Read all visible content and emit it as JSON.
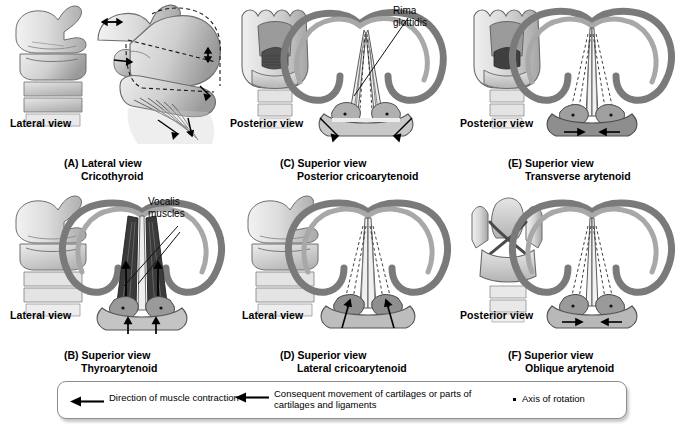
{
  "figure": {
    "panels": [
      {
        "id": "A",
        "thumb_view": "Lateral view",
        "caption_line1": "(A) Lateral view",
        "caption_line2": "Cricothyroid",
        "annotations": []
      },
      {
        "id": "C",
        "thumb_view": "Posterior view",
        "caption_line1": "(C) Superior view",
        "caption_line2": "Posterior cricoarytenoid",
        "annotations": [
          "Rima",
          "glottidis"
        ]
      },
      {
        "id": "E",
        "thumb_view": "Posterior view",
        "caption_line1": "(E) Superior view",
        "caption_line2": "Transverse arytenoid",
        "annotations": []
      },
      {
        "id": "B",
        "thumb_view": "Lateral view",
        "caption_line1": "(B) Superior view",
        "caption_line2": "Thyroarytenoid",
        "annotations": [
          "Vocalis",
          "muscles"
        ]
      },
      {
        "id": "D",
        "thumb_view": "Lateral view",
        "caption_line1": "(D) Superior view",
        "caption_line2": "Lateral cricoarytenoid",
        "annotations": []
      },
      {
        "id": "F",
        "thumb_view": "Posterior view",
        "caption_line1": "(F) Superior view",
        "caption_line2": "Oblique arytenoid",
        "annotations": []
      }
    ],
    "annotation_rima": "Rima\nglottidis",
    "annotation_rima_l1": "Rima",
    "annotation_rima_l2": "glottidis",
    "annotation_vocalis_l1": "Vocalis",
    "annotation_vocalis_l2": "muscles"
  },
  "legend": {
    "items": [
      {
        "icon": "left-arrow-icon",
        "text": "Direction of muscle contraction"
      },
      {
        "icon": "left-arrow-icon",
        "text": "Consequent movement of cartilages or parts of\ncartilages and ligaments"
      },
      {
        "icon": "dot-icon",
        "text": "Axis of rotation"
      }
    ]
  },
  "colors": {
    "ink": "#000000",
    "cartilage_light": "#e3e3e3",
    "cartilage_mid": "#bdbdbd",
    "cartilage_dark": "#8f8f8f",
    "muscle_dark": "#4a4a4a",
    "legend_border": "#8d8d8d",
    "background": "#ffffff"
  }
}
